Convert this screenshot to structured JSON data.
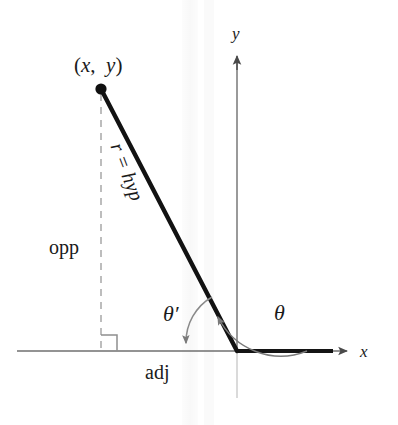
{
  "figure": {
    "background_color": "#ffffff",
    "ink_color": "#1a1a1a",
    "axis_color": "#6b6b6b",
    "dashed_color": "#a8a8a8",
    "arc_color": "#7a7a7a",
    "width": 398,
    "height": 425
  },
  "labels": {
    "point": {
      "open": "(",
      "x": "x",
      "comma": ",",
      "y": "y",
      "close": ")"
    },
    "x_axis": "x",
    "y_axis": "y",
    "opposite": "opp",
    "adjacent": "adj",
    "hypotenuse": "r = hyp",
    "theta": "θ",
    "theta_prime": "θ′"
  },
  "geometry": {
    "origin": {
      "x": 237,
      "y": 351
    },
    "point": {
      "x": 101,
      "y": 89
    },
    "foot_of_perpendicular": {
      "x": 101,
      "y": 351
    },
    "x_axis_arrow_tip": {
      "x": 352,
      "y": 351
    },
    "y_axis_arrow_tip": {
      "x": 237,
      "y": 52
    },
    "theta_arc_radius": 70,
    "theta_prime_arc_radius": 52,
    "right_angle_marker_size": 16,
    "point_dot_radius": 5.5
  }
}
